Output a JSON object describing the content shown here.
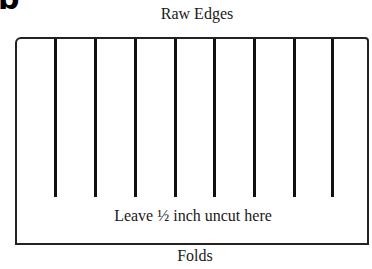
{
  "figure": {
    "panel_letter": "b",
    "top_label": "Raw Edges",
    "bottom_label": "Folds",
    "note": "Leave ½ inch uncut here",
    "cut_lines": [
      55,
      95,
      135,
      175,
      214,
      254,
      294,
      332
    ]
  }
}
